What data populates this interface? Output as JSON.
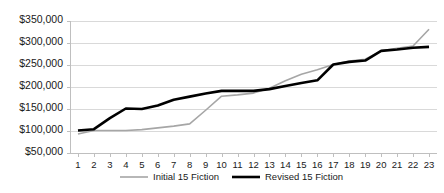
{
  "chart_data": {
    "type": "line",
    "title": "",
    "xlabel": "",
    "ylabel": "",
    "x": [
      1,
      2,
      3,
      4,
      5,
      6,
      7,
      8,
      9,
      10,
      11,
      12,
      13,
      14,
      15,
      16,
      17,
      18,
      19,
      20,
      21,
      22,
      23
    ],
    "xtick_labels": [
      "1",
      "2",
      "3",
      "4",
      "5",
      "6",
      "7",
      "8",
      "9",
      "10",
      "11",
      "12",
      "13",
      "14",
      "15",
      "16",
      "17",
      "18",
      "19",
      "20",
      "21",
      "22",
      "23"
    ],
    "ytick_labels": [
      "$50,000",
      "$100,000",
      "$150,000",
      "$200,000",
      "$250,000",
      "$300,000",
      "$350,000"
    ],
    "ytick_values": [
      50000,
      100000,
      150000,
      200000,
      250000,
      300000,
      350000
    ],
    "ylim": [
      50000,
      350000
    ],
    "grid": true,
    "legend_position": "bottom",
    "series": [
      {
        "name": "Initial  15 Fiction",
        "color": "#a6a6a6",
        "width": 1.6,
        "values": [
          92000,
          100000,
          100000,
          100000,
          102000,
          106000,
          110000,
          115000,
          146000,
          178000,
          181000,
          185000,
          196000,
          213000,
          228000,
          238000,
          250000,
          258000,
          262000,
          281000,
          287000,
          292000,
          330000
        ]
      },
      {
        "name": "Revised 15 Fiction",
        "color": "#000000",
        "width": 2.6,
        "values": [
          100000,
          103000,
          128000,
          150000,
          149000,
          157000,
          170000,
          177000,
          184000,
          190000,
          190000,
          190000,
          194000,
          201000,
          208000,
          214000,
          250000,
          256000,
          259000,
          281000,
          284000,
          288000,
          290000
        ]
      }
    ]
  },
  "legend": {
    "items": [
      {
        "label": "Initial  15 Fiction",
        "color": "#a6a6a6"
      },
      {
        "label": "Revised 15 Fiction",
        "color": "#000000"
      }
    ]
  }
}
